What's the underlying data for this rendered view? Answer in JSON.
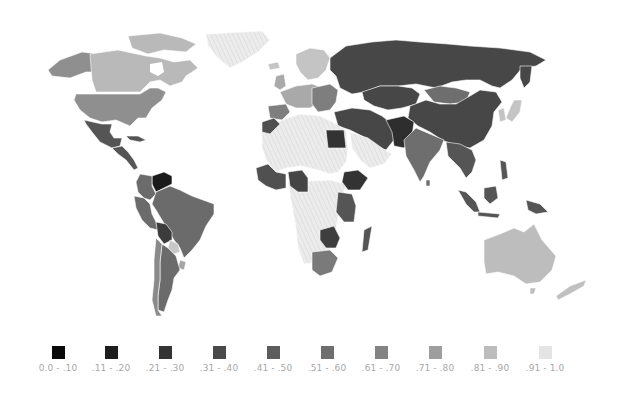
{
  "map": {
    "type": "choropleth",
    "projection": "world",
    "palette": "grayscale",
    "no_data_pattern": "light diagonal hatch",
    "regions": {
      "greenland": {
        "bin": "no-data"
      },
      "canada": {
        "bin": 7,
        "color": "#b9b9b9"
      },
      "alaska": {
        "bin": 6,
        "color": "#8f8f8f"
      },
      "usa": {
        "bin": 6,
        "color": "#8f8f8f"
      },
      "mexico": {
        "bin": 4,
        "color": "#555555"
      },
      "central_america": {
        "bin": 4,
        "color": "#555555"
      },
      "venezuela": {
        "bin": 1,
        "color": "#1a1a1a"
      },
      "colombia": {
        "bin": 5,
        "color": "#6b6b6b"
      },
      "brazil": {
        "bin": 5,
        "color": "#6b6b6b"
      },
      "peru": {
        "bin": 5,
        "color": "#6b6b6b"
      },
      "bolivia": {
        "bin": 3,
        "color": "#3c3c3c"
      },
      "paraguay": {
        "bin": 8,
        "color": "#c8c8c8"
      },
      "uruguay": {
        "bin": 7,
        "color": "#a4a4a4"
      },
      "argentina": {
        "bin": 5,
        "color": "#6b6b6b"
      },
      "chile": {
        "bin": 6,
        "color": "#8a8a8a"
      },
      "western_europe": {
        "bin": 7,
        "color": "#a9a9a9"
      },
      "scandinavia": {
        "bin": 8,
        "color": "#c4c4c4"
      },
      "eastern_europe": {
        "bin": 6,
        "color": "#7e7e7e"
      },
      "russia": {
        "bin": 3,
        "color": "#474747"
      },
      "central_asia": {
        "bin": 3,
        "color": "#474747"
      },
      "mongolia": {
        "bin": 5,
        "color": "#6e6e6e"
      },
      "china": {
        "bin": 3,
        "color": "#474747"
      },
      "middle_east": {
        "bin": 3,
        "color": "#474747"
      },
      "afghanistan_pakistan": {
        "bin": 2,
        "color": "#2e2e2e"
      },
      "india": {
        "bin": 5,
        "color": "#6e6e6e"
      },
      "southeast_asia": {
        "bin": 4,
        "color": "#555555"
      },
      "japan_korea": {
        "bin": 8,
        "color": "#c4c4c4"
      },
      "indonesia": {
        "bin": 4,
        "color": "#555555"
      },
      "australia": {
        "bin": 8,
        "color": "#bdbdbd"
      },
      "new_zealand": {
        "bin": 8,
        "color": "#c0c0c0"
      },
      "egypt": {
        "bin": 2,
        "color": "#333333"
      },
      "north_africa_saharan": {
        "bin": "no-data"
      },
      "arabia": {
        "bin": "no-data"
      },
      "west_africa": {
        "bin": 4,
        "color": "#505050"
      },
      "nigeria": {
        "bin": 3,
        "color": "#454545"
      },
      "ethiopia": {
        "bin": 2,
        "color": "#333333"
      },
      "east_africa": {
        "bin": 4,
        "color": "#555555"
      },
      "zambia_zimbabwe": {
        "bin": 3,
        "color": "#3e3e3e"
      },
      "south_africa": {
        "bin": 6,
        "color": "#7a7a7a"
      },
      "madagascar": {
        "bin": 4,
        "color": "#555555"
      }
    }
  },
  "legend": {
    "items": [
      {
        "label": "0.0 - .10",
        "color": "#0a0a0a"
      },
      {
        "label": ".11 - .20",
        "color": "#1e1e1e"
      },
      {
        "label": ".21 - .30",
        "color": "#333333"
      },
      {
        "label": ".31 - .40",
        "color": "#4a4a4a"
      },
      {
        "label": ".41 - .50",
        "color": "#5c5c5c"
      },
      {
        "label": ".51 - .60",
        "color": "#6e6e6e"
      },
      {
        "label": ".61 - .70",
        "color": "#838383"
      },
      {
        "label": ".71 - .80",
        "color": "#9e9e9e"
      },
      {
        "label": ".81 - .90",
        "color": "#bcbcbc"
      },
      {
        "label": ".91 - 1.0",
        "color": "#e4e4e4"
      }
    ]
  }
}
